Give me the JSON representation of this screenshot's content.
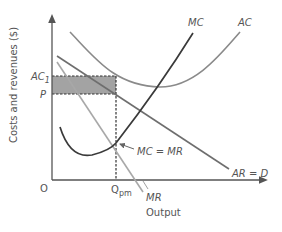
{
  "diagram": {
    "title": "",
    "type": "economics-monopoly-cost-revenue",
    "axes": {
      "y_label": "Costs and revenues ($)",
      "x_label": "Output",
      "origin_label": "O"
    },
    "price_levels": {
      "ac1_label": "AC",
      "ac1_subscript": "1",
      "p_label": "P"
    },
    "quantity_levels": {
      "q_label": "Q",
      "q_subscript": "pm"
    },
    "curves": {
      "mc_label": "MC",
      "ac_label": "AC",
      "ar_label": "AR = D",
      "mr_label": "MR"
    },
    "annotations": {
      "mc_eq_mr": "MC = MR"
    },
    "colors": {
      "axis": "#555555",
      "mc": "#3a3a3a",
      "ac": "#8a8a8a",
      "ar": "#6e6e6e",
      "mr": "#a8a8a8",
      "shade": "#a0a0a0",
      "dash": "#333333",
      "text": "#555555"
    }
  }
}
